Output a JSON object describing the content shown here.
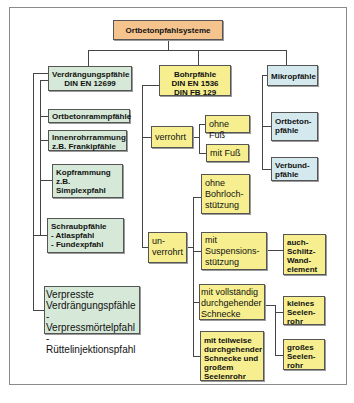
{
  "diagram": {
    "title": "Ortbetonpfahlsysteme",
    "colors": {
      "root": "#f5c48e",
      "verdraengung": "#d6e9d8",
      "bohr": "#f7ef8f",
      "mikro": "#d4e9ee",
      "line": "#444444"
    },
    "verdraengung": {
      "header": "Verdrängungspfähle\nDIN EN 12699",
      "items": [
        "Ortbetonrammpfähle",
        "Innenrohrrammung\nz.B. Frankipfähle",
        "Kopframmung\nz.B.\nSimplexpfahl",
        "Schraubpfähle\n   -   Atlaspfahl\n   -   Fundexpfahl",
        "Verpresste\nVerdrängungspfähle\n- Verpressmörtelpfahl\n- Rüttelinjektionspfahl"
      ]
    },
    "bohr": {
      "header": "Bohrpfähle\nDIN EN 1536\nDIN FB 129",
      "verrohrt": {
        "label": "verrohrt",
        "children": [
          "ohne Fuß",
          "mit Fuß"
        ]
      },
      "unverrohrt": {
        "label": "un-\nverrohrt",
        "children": [
          "ohne\nBohrloch-\nstützung",
          "mit\nSuspensions-\nstützung",
          "mit vollständig\ndurchgehender\nSchnecke",
          "mit teilweise\ndurchgehender\nSchnecke und\ngroßem\nSeelenrohr"
        ],
        "suspension_child": "auch-\nSchlitz-\nWand-\nelement",
        "schnecke_children": [
          "kleines\nSeelen-\nrohr",
          "großes\nSeelen-\nrohr"
        ]
      }
    },
    "mikro": {
      "header": "Mikropfähle",
      "items": [
        "Ortbeton-\npfähle",
        "Verbund-\npfähle"
      ]
    }
  }
}
